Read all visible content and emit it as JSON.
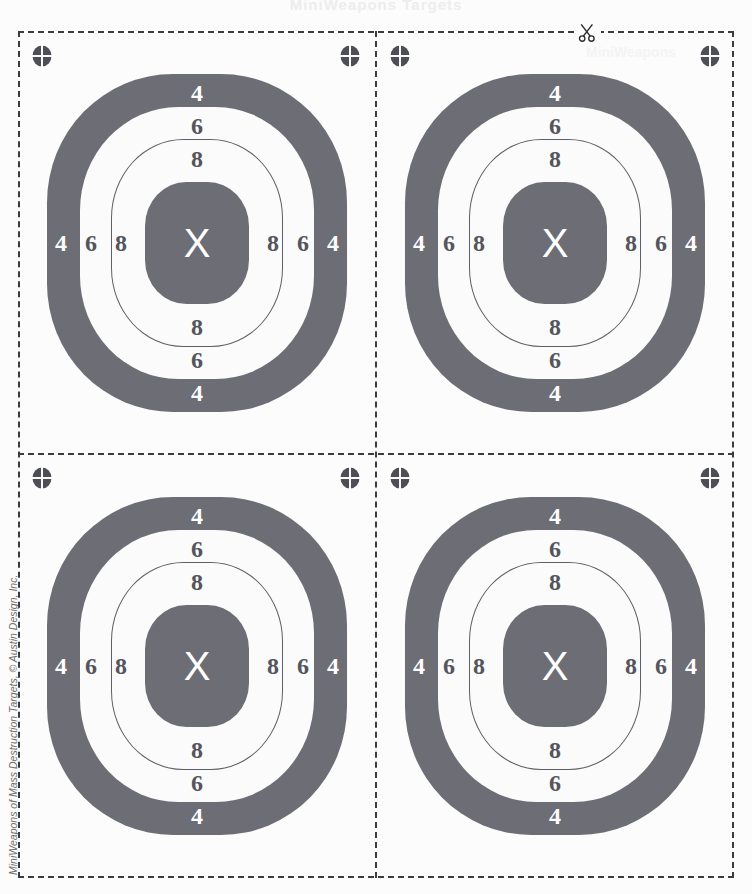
{
  "page": {
    "title": "MiniWeapons Targets",
    "corner_watermark": "MiniWeapons",
    "copyright": "MiniWeapons of Mass Destruction Targets, © Austin Design, Inc.",
    "background_color": "#fcfcfc",
    "border_color": "#3c3c3c"
  },
  "icons": {
    "scissors": "scissors-icon",
    "registration": "registration-mark-icon"
  },
  "target": {
    "name": "bullseye-target",
    "center_label": "X",
    "ring_dark_color": "#6d6d75",
    "ring_light_color": "#fbfbfb",
    "outline_color": "#5f5f67",
    "rings": [
      {
        "score": "4",
        "fill": "dark",
        "label_color": "light"
      },
      {
        "score": "6",
        "fill": "light",
        "label_color": "dark"
      },
      {
        "score": "8",
        "fill": "outline",
        "label_color": "dark"
      },
      {
        "score": "X",
        "fill": "dark",
        "label_color": "light"
      }
    ],
    "scores": {
      "top": [
        "4",
        "6",
        "8"
      ],
      "bottom": [
        "8",
        "6",
        "4"
      ],
      "left": [
        "4",
        "6",
        "8"
      ],
      "right": [
        "8",
        "6",
        "4"
      ]
    }
  },
  "quadrants": [
    {
      "id": "top-left",
      "name": "target-panel-top-left"
    },
    {
      "id": "top-right",
      "name": "target-panel-top-right"
    },
    {
      "id": "bottom-left",
      "name": "target-panel-bottom-left"
    },
    {
      "id": "bottom-right",
      "name": "target-panel-bottom-right"
    }
  ]
}
